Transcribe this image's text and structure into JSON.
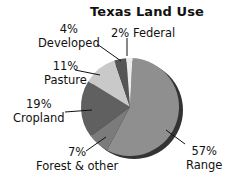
{
  "chart_data": {
    "type": "pie",
    "title": "Texas Land Use",
    "slices": [
      {
        "label": "Range",
        "value": 57,
        "pct_label": "57%",
        "color": "#8f8f8f"
      },
      {
        "label": "Forest & other",
        "value": 7,
        "pct_label": "7%",
        "color": "#7b7b7b"
      },
      {
        "label": "Cropland",
        "value": 19,
        "pct_label": "19%",
        "color": "#606060"
      },
      {
        "label": "Pasture",
        "value": 11,
        "pct_label": "11%",
        "color": "#c9c9c9"
      },
      {
        "label": "Developed",
        "value": 4,
        "pct_label": "4%",
        "color": "#555555"
      },
      {
        "label": "Federal",
        "value": 2,
        "pct_label": "2%",
        "color": "#ebebeb"
      }
    ],
    "shadow_color": "#333333",
    "legend": "none (callout labels)"
  },
  "labels": {
    "title": "Texas Land Use",
    "federal": "2% Federal",
    "developed_pct": "4%",
    "developed_name": "Developed",
    "pasture_pct": "11%",
    "pasture_name": "Pasture",
    "cropland_pct": "19%",
    "cropland_name": "Cropland",
    "forest_pct": "7%",
    "forest_name": "Forest & other",
    "range_pct": "57%",
    "range_name": "Range"
  }
}
